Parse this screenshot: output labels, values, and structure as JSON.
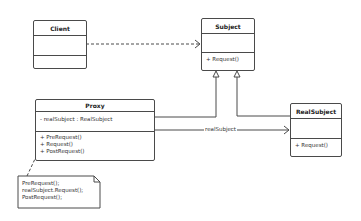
{
  "diagram": {
    "type": "UML class diagram",
    "classes": {
      "client": {
        "name": "Client",
        "attributes": [],
        "operations": []
      },
      "subject": {
        "name": "Subject",
        "attributes": [],
        "operations": [
          "+ Request()"
        ]
      },
      "proxy": {
        "name": "Proxy",
        "attributes": [
          "- realSubject : RealSubject"
        ],
        "operations": [
          "+ PreRequest()",
          "+ Request()",
          "+ PostRequest()"
        ]
      },
      "real_subject": {
        "name": "RealSubject",
        "attributes": [],
        "operations": [
          "+ Request()"
        ]
      }
    },
    "relations": {
      "client_subject": {
        "type": "dependency",
        "from": "Client",
        "to": "Subject"
      },
      "proxy_subject": {
        "type": "generalization",
        "from": "Proxy",
        "to": "Subject"
      },
      "realsubject_subject": {
        "type": "generalization",
        "from": "RealSubject",
        "to": "Subject"
      },
      "proxy_realsubject": {
        "type": "association",
        "from": "Proxy",
        "to": "RealSubject",
        "label": "realSubject"
      }
    },
    "note": {
      "lines": [
        "PreRequest();",
        "realSubject.Request();",
        "PostRequest();"
      ],
      "attached_to": "Proxy.Request()"
    }
  },
  "colors": {
    "line": "#4a4a4a",
    "text": "#333333",
    "background": "#ffffff"
  }
}
